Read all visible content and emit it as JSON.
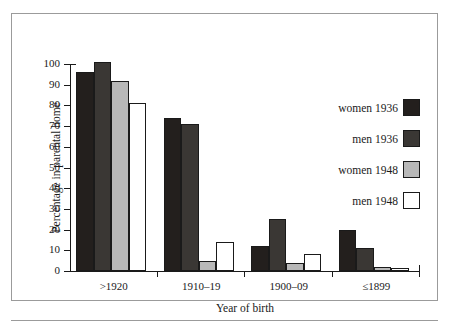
{
  "chart_data": {
    "type": "bar",
    "title": "",
    "xlabel": "Year of birth",
    "ylabel": "Percentage in parental home",
    "categories": [
      ">1920",
      "1910–19",
      "1900–09",
      "≤1899"
    ],
    "ylim": [
      0,
      100
    ],
    "yticks": [
      0,
      10,
      20,
      30,
      40,
      50,
      60,
      70,
      80,
      90,
      100
    ],
    "grid": false,
    "legend_position": "right",
    "series": [
      {
        "name": "women 1936",
        "color": "#231f1d",
        "values": [
          96,
          74,
          12,
          20
        ]
      },
      {
        "name": "men 1936",
        "color": "#3a3734",
        "values": [
          101,
          71,
          25,
          11
        ]
      },
      {
        "name": "women 1948",
        "color": "#b8b8b8",
        "values": [
          92,
          5,
          4,
          2
        ]
      },
      {
        "name": "men 1948",
        "color": "#ffffff",
        "values": [
          81,
          14,
          8,
          1.5
        ]
      }
    ]
  },
  "axis": {
    "y_tick_labels": [
      "0",
      "10",
      "20",
      "30",
      "40",
      "50",
      "60",
      "70",
      "80",
      "90",
      "100"
    ],
    "y_title": "Percentage in parental home",
    "x_title": "Year of birth",
    "x_tick_labels": [
      ">1920",
      "1910–19",
      "1900–09",
      "≤1899"
    ]
  },
  "legend": {
    "items": [
      {
        "label": "women 1936",
        "color": "#231f1d"
      },
      {
        "label": "men 1936",
        "color": "#3a3734"
      },
      {
        "label": "women 1948",
        "color": "#b8b8b8"
      },
      {
        "label": "men 1948",
        "color": "#ffffff"
      }
    ]
  },
  "colors": {
    "axis": "#1a1a1a",
    "frame": "#9b9b9b",
    "background": "#ffffff"
  }
}
